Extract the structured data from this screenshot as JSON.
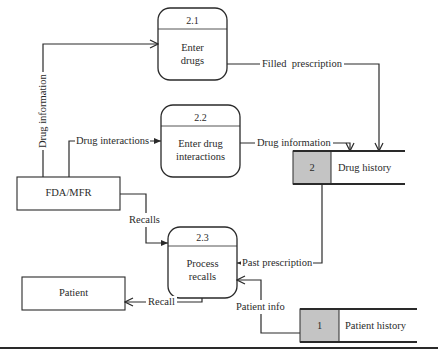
{
  "diagram": {
    "type": "data-flow-diagram",
    "processes": [
      {
        "id": "2.1",
        "label_line1": "Enter",
        "label_line2": "drugs"
      },
      {
        "id": "2.2",
        "label_line1": "Enter drug",
        "label_line2": "interactions"
      },
      {
        "id": "2.3",
        "label_line1": "Process",
        "label_line2": "recalls"
      }
    ],
    "entities": [
      {
        "label": "FDA/MFR"
      },
      {
        "label": "Patient"
      }
    ],
    "data_stores": [
      {
        "id": "2",
        "label": "Drug history"
      },
      {
        "id": "1",
        "label": "Patient history"
      }
    ],
    "flows": {
      "drug_information_vertical": "Drug information",
      "drug_interactions": "Drug interactions",
      "filled_prescription": "Filled  prescription",
      "drug_information_to_store": "Drug information",
      "recalls": "Recalls",
      "past_prescription": "Past prescription",
      "recall": "Recall",
      "patient_info": "Patient info"
    },
    "colors": {
      "line": "#2a2a2a",
      "store_id_fill": "#c4c4c4",
      "background": "#ffffff"
    }
  }
}
